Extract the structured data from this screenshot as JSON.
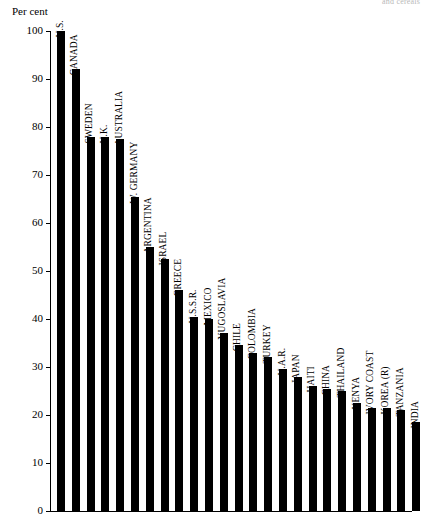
{
  "bleed_caption": "and cereals",
  "chart_data": {
    "type": "bar",
    "title": "",
    "xlabel": "",
    "ylabel": "Per cent",
    "ylim": [
      0,
      100
    ],
    "yticks": [
      0,
      10,
      20,
      30,
      40,
      50,
      60,
      70,
      80,
      90,
      100
    ],
    "ytick_labels": [
      "0",
      "10",
      "20",
      "30",
      "40",
      "50",
      "60",
      "70",
      "80",
      "90",
      "100"
    ],
    "grid": false,
    "legend": null,
    "bar_color": "#000000",
    "categories": [
      "U.S.",
      "CANADA",
      "SWEDEN",
      "U.K.",
      "AUSTRALIA",
      "W. GERMANY",
      "ARGENTINA",
      "ISRAEL",
      "GREECE",
      "U.S.S.R.",
      "MEXICO",
      "YUGOSLAVIA",
      "CHILE",
      "COLOMBIA",
      "TURKEY",
      "U.A.R.",
      "JAPAN",
      "HAITI",
      "CHINA",
      "THAILAND",
      "KENYA",
      "IVORY COAST",
      "KOREA (R)",
      "TANZANIA",
      "INDIA"
    ],
    "values": [
      100,
      92,
      78,
      78,
      77.5,
      65.5,
      55,
      52.5,
      46,
      40.5,
      40,
      37,
      34.5,
      33,
      32,
      29.5,
      28,
      26,
      25.5,
      25,
      22.5,
      21.5,
      21.5,
      21,
      18.5
    ]
  }
}
